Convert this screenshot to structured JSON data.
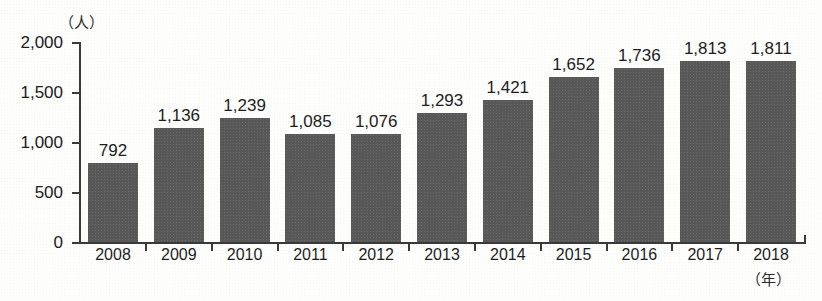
{
  "axes": {
    "y_unit_label": "（人）",
    "x_unit_label": "（年）"
  },
  "chart_data": {
    "type": "bar",
    "title": "",
    "subtitle": "",
    "xlabel": "（年）",
    "ylabel": "（人）",
    "categories": [
      "2008",
      "2009",
      "2010",
      "2011",
      "2012",
      "2013",
      "2014",
      "2015",
      "2016",
      "2017",
      "2018"
    ],
    "values": [
      792,
      1136,
      1239,
      1085,
      1076,
      1293,
      1421,
      1652,
      1736,
      1813,
      1811
    ],
    "value_labels": [
      "792",
      "1,136",
      "1,239",
      "1,085",
      "1,076",
      "1,293",
      "1,421",
      "1,652",
      "1,736",
      "1,813",
      "1,811"
    ],
    "ylim": [
      0,
      2000
    ],
    "ytick_values": [
      0,
      500,
      1000,
      1500,
      2000
    ],
    "ytick_labels": [
      "0",
      "500",
      "1,000",
      "1,500",
      "2,000"
    ],
    "grid": false,
    "legend": null,
    "legend_position": "none",
    "bar_color": "#585858",
    "axis_color": "#3a3a3a",
    "background_color": "#fdfdfc",
    "annotations": []
  }
}
